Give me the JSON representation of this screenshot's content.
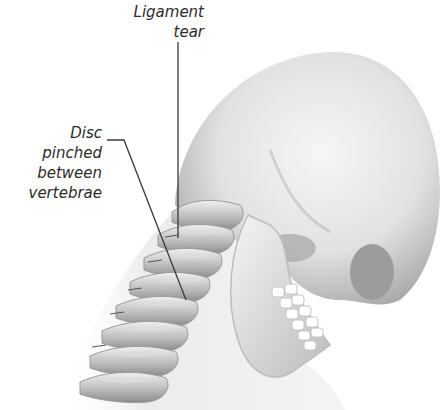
{
  "figure": {
    "colors": {
      "background": "#ffffff",
      "bone_light": "#f2f2f2",
      "bone_mid": "#cfcfcf",
      "bone_shadow": "#8e8e8e",
      "leader_line": "#3a3a3a",
      "label_text": "#2b2b2b"
    }
  },
  "labels": {
    "ligament": {
      "line1": "Ligament",
      "line2": "tear"
    },
    "disc": {
      "line1": "Disc",
      "line2": "pinched",
      "line3": "between",
      "line4": "vertebrae"
    }
  }
}
